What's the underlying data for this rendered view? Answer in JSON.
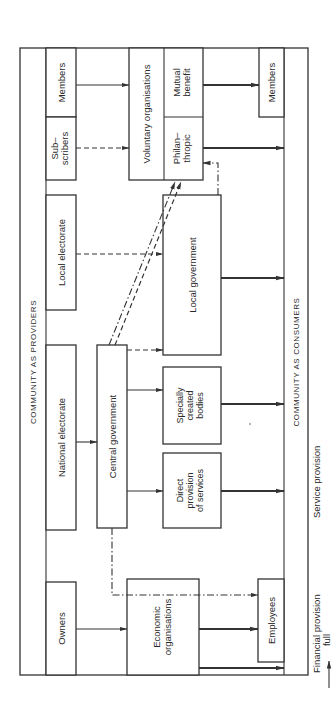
{
  "orientation": "rotated 90 degrees counter-clockwise",
  "sections": {
    "providers_label": "COMMUNITY AS PROVIDERS",
    "consumers_label": "COMMUNITY AS CONSUMERS"
  },
  "providers": {
    "members": "Members",
    "subscribers_line1": "Sub–",
    "subscribers_line2": "scribers",
    "local_electorate": "Local electorate",
    "national_electorate": "National electorate",
    "owners": "Owners"
  },
  "organisations": {
    "central_government": "Central government",
    "economic_line1": "Economic",
    "economic_line2": "organisations",
    "voluntary": "Voluntary organisations",
    "mutual_line1": "Mutual",
    "mutual_line2": "benefit",
    "philan_line1": "Philan–",
    "philan_line2": "thropic",
    "local_government": "Local government",
    "specially_line1": "Specially",
    "specially_line2": "created",
    "specially_line3": "bodies",
    "direct_line1": "Direct",
    "direct_line2": "provision",
    "direct_line3": "of services"
  },
  "consumers": {
    "members": "Members",
    "employees": "Employees"
  },
  "legend": {
    "financial_provision": "Financial provision",
    "full": "full",
    "service_provision": "Service provision"
  },
  "edges": [
    {
      "from": "Members",
      "to": "Voluntary organisations",
      "style": "full"
    },
    {
      "from": "Sub-scribers",
      "to": "Voluntary organisations",
      "style": "dashed"
    },
    {
      "from": "Local electorate",
      "to": "Local government",
      "style": "dashed"
    },
    {
      "from": "National electorate",
      "to": "Central government",
      "style": "full"
    },
    {
      "from": "Owners",
      "to": "Economic organisations",
      "style": "full"
    },
    {
      "from": "Central government",
      "to": "Local government",
      "style": "dashed"
    },
    {
      "from": "Central government",
      "to": "Specially created bodies",
      "style": "full"
    },
    {
      "from": "Central government",
      "to": "Direct provision of services",
      "style": "full"
    },
    {
      "from": "Central government",
      "to": "Philanthropic",
      "style": "dash-dot"
    },
    {
      "from": "Central government",
      "to": "Philanthropic",
      "style": "dashed"
    },
    {
      "from": "Central government",
      "to": "Employees",
      "style": "dash-dot"
    },
    {
      "from": "Local government",
      "to": "Philanthropic",
      "style": "dash-dot"
    },
    {
      "from": "Mutual benefit",
      "to": "Members",
      "style": "service"
    },
    {
      "from": "Philanthropic",
      "to": "Community as consumers",
      "style": "service"
    },
    {
      "from": "Local government",
      "to": "Community as consumers",
      "style": "service"
    },
    {
      "from": "Specially created bodies",
      "to": "Community as consumers",
      "style": "service"
    },
    {
      "from": "Direct provision of services",
      "to": "Community as consumers",
      "style": "service"
    },
    {
      "from": "Economic organisations",
      "to": "Employees",
      "style": "service"
    },
    {
      "from": "Economic organisations",
      "to": "Community as consumers",
      "style": "service"
    }
  ]
}
